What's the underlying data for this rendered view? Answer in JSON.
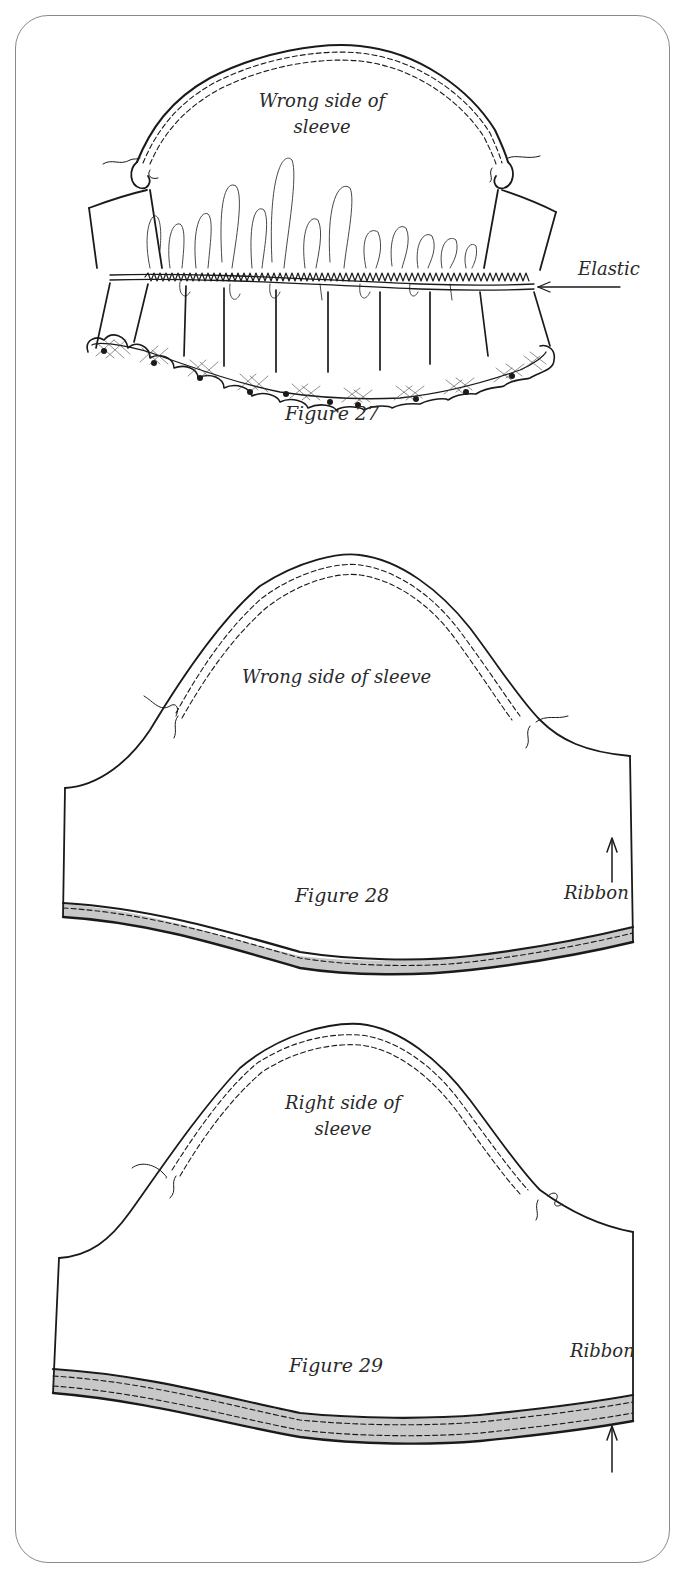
{
  "page": {
    "border_color": "#8a8a8a",
    "line_color": "#1a1a1a",
    "ribbon_fill": "#c8c8c8"
  },
  "figures": [
    {
      "id": "figure-27",
      "caption": "Figure 27",
      "labels": {
        "sleeve_side_line1": "Wrong side of",
        "sleeve_side_line2": "sleeve",
        "callout": "Elastic"
      },
      "description": "Sleeve gathered with elastic stitched across lower edge, lace ruffle hem"
    },
    {
      "id": "figure-28",
      "caption": "Figure 28",
      "labels": {
        "sleeve_side": "Wrong side of sleeve",
        "callout": "Ribbon"
      },
      "description": "Flat sleeve with ribbon stitched along curved lower edge (single stitch line)"
    },
    {
      "id": "figure-29",
      "caption": "Figure 29",
      "labels": {
        "sleeve_side_line1": "Right side of",
        "sleeve_side_line2": "sleeve",
        "callout": "Ribbon"
      },
      "description": "Flat sleeve with ribbon stitched along curved lower edge (double stitch lines)"
    }
  ]
}
